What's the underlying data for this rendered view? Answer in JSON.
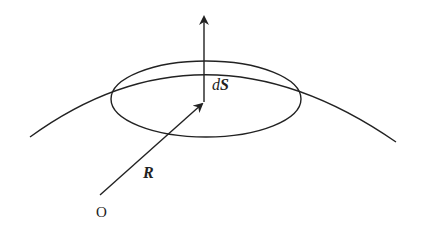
{
  "diagram": {
    "type": "vector-surface-element",
    "labels": {
      "surface_element": {
        "d": "d",
        "S": "S"
      },
      "position_vector": "R",
      "origin": "O"
    },
    "colors": {
      "stroke": "#222222",
      "background": "#ffffff"
    }
  }
}
